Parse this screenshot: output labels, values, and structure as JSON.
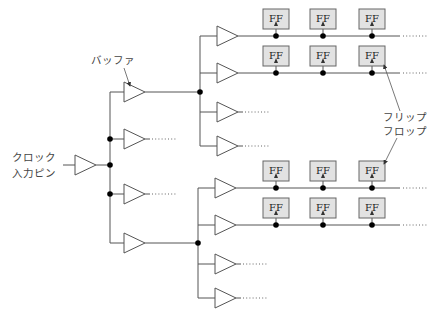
{
  "labels": {
    "buffer": "バッファ",
    "clock_pin_line1": "クロック",
    "clock_pin_line2": "入力ピン",
    "flipflop_line1": "フリップ",
    "flipflop_line2": "フロップ",
    "ff": "FF",
    "continuation": "……"
  },
  "colors": {
    "wire": "#555555",
    "ff_fill": "#e2e2e2",
    "ff_stroke": "#666666",
    "node": "#000000"
  },
  "root": {
    "input_x": 63,
    "buf_x": 75,
    "y": 165,
    "bus_x": 110
  },
  "level1": {
    "bus_x": 110,
    "buf_x": 124,
    "buffers": [
      {
        "y": 92,
        "expanded": true
      },
      {
        "y": 139,
        "expanded": false
      },
      {
        "y": 194,
        "expanded": false
      },
      {
        "y": 243,
        "expanded": true
      }
    ]
  },
  "level2_groups": [
    {
      "bus_x": 200,
      "node_y": 92,
      "rows": [
        {
          "y": 36,
          "ff": true
        },
        {
          "y": 73,
          "ff": true
        },
        {
          "y": 112,
          "ff": false
        },
        {
          "y": 146,
          "ff": false
        }
      ]
    },
    {
      "bus_x": 198,
      "node_y": 243,
      "rows": [
        {
          "y": 188,
          "ff": true
        },
        {
          "y": 225,
          "ff": true
        },
        {
          "y": 264,
          "ff": false
        },
        {
          "y": 298,
          "ff": false
        }
      ]
    }
  ],
  "ff_columns_x": [
    276,
    323,
    372
  ],
  "line_end_x": 400
}
